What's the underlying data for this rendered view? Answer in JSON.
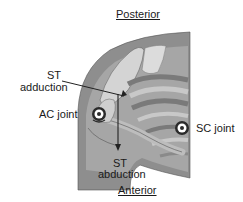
{
  "diagram": {
    "labels": {
      "top": "Posterior",
      "bottom": "Anterior",
      "st_adduction_1": "ST",
      "st_adduction_2": "adduction",
      "st_abduction_1": "ST",
      "st_abduction_2": "abduction",
      "ac_joint": "AC joint",
      "sc_joint": "SC joint"
    },
    "colors": {
      "outer_shell": "#8a8a8a",
      "scapula_light": "#cfcfcf",
      "mid_gray": "#a8a8a8",
      "dark": "#3a3a3a",
      "text": "#1a1a1a"
    }
  }
}
